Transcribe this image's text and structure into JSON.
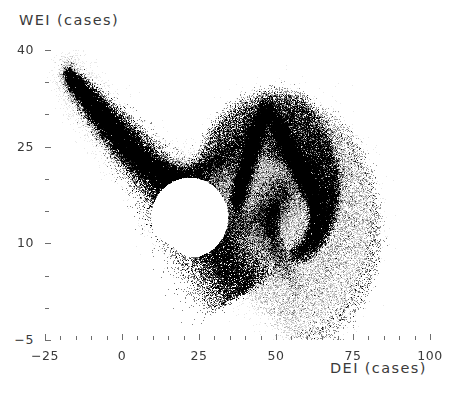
{
  "figure": {
    "background": "#ffffff",
    "point_color": "#1a1a1a",
    "axis_color": "#6e6e6e",
    "text_color": "#3a3a3a"
  },
  "labels": {
    "y_axis_title": "WEI (cases)",
    "x_axis_title": "DEI (cases)",
    "caption": ""
  },
  "chart_data": {
    "type": "scatter",
    "title": "",
    "subtitle": "",
    "xlabel": "DEI (cases)",
    "ylabel": "WEI (cases)",
    "xlim": [
      -25,
      100
    ],
    "ylim": [
      -5,
      40
    ],
    "xticks": [
      -25,
      0,
      25,
      50,
      75,
      100
    ],
    "xtick_labels": [
      "−25",
      "0",
      "25",
      "50",
      "75",
      "100"
    ],
    "yticks": [
      -5,
      10,
      25,
      40
    ],
    "ytick_labels": [
      "−5",
      "10",
      "25",
      "40"
    ],
    "x_minor_tick_interval": 5,
    "y_minor_tick_interval": 5,
    "grid": false,
    "legend": null,
    "annotations": [],
    "marker": "dot",
    "marker_size_px": 1,
    "point_count_approx": 120000,
    "bounds_observed": {
      "x_min": -18.0,
      "x_max": 83.0,
      "y_min": -3.5,
      "y_max": 36.8
    },
    "features": [
      {
        "name": "upper-left cusp",
        "x": -18.0,
        "y": 36.5
      },
      {
        "name": "dense spine midpoint",
        "x": 2.0,
        "y": 22.0
      },
      {
        "name": "right-lobe cusp",
        "x": 47.0,
        "y": 31.0
      },
      {
        "name": "central white lacuna",
        "x": 22.0,
        "y": 14.0
      },
      {
        "name": "right extremum",
        "x": 83.0,
        "y": 6.0
      },
      {
        "name": "lower extremum",
        "x": 55.0,
        "y": -3.5
      }
    ]
  }
}
